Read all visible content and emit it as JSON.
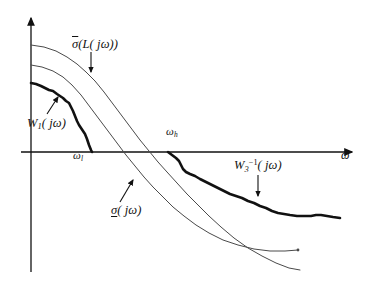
{
  "figure": {
    "kind": "loop-shaping-singular-value-plot",
    "background_color": "#ffffff",
    "ink_color": "#111111",
    "thin_curve_color": "#4a4a4a"
  },
  "axes": {
    "x_axis": {
      "label": "ω",
      "y_pixel": 152,
      "x_start": 21,
      "x_end": 352,
      "arrow": "right"
    },
    "y_axis": {
      "label": "",
      "x_pixel": 31,
      "y_top": 18,
      "y_bottom": 272,
      "arrow": "up"
    }
  },
  "tick_labels": [
    {
      "name": "omega-l",
      "base": "ω",
      "subscript": "l",
      "x": 73,
      "y": 150
    },
    {
      "name": "omega-h",
      "base": "ω",
      "subscript": "h",
      "x": 166,
      "y": 126
    }
  ],
  "annotations": [
    {
      "name": "sigma-bar-L",
      "text_parts": {
        "sigma": "σ",
        "rest": "(L( jω))"
      },
      "overbar": true,
      "underbar": false,
      "arrow": {
        "x1": 91,
        "y1": 52,
        "x2": 91,
        "y2": 72,
        "direction": "down"
      }
    },
    {
      "name": "W1",
      "text_parts": {
        "base": "W",
        "subscript": "1",
        "rest": "( jω)"
      },
      "arrow": {
        "x1": 47,
        "y1": 114,
        "x2": 58,
        "y2": 97,
        "direction": "up-right"
      }
    },
    {
      "name": "sigma-underline",
      "text_parts": {
        "sigma": "σ",
        "rest": "( jω)"
      },
      "overbar": false,
      "underbar": true,
      "arrow": {
        "x1": 120,
        "y1": 202,
        "x2": 133,
        "y2": 180,
        "direction": "up-right"
      }
    },
    {
      "name": "W3-inverse",
      "text_parts": {
        "base": "W",
        "subscript": "3",
        "superscript": "−1",
        "rest": "( jω)"
      },
      "arrow": {
        "x1": 258,
        "y1": 175,
        "x2": 258,
        "y2": 196,
        "direction": "down"
      }
    }
  ],
  "chart_data": {
    "type": "line",
    "title": "",
    "xlabel": "ω",
    "ylabel": "",
    "grid": false,
    "legend": "inline-annotations",
    "note": "Magnitude (dB) versus frequency on a log axis; curves given as pixel polylines in the figure coordinate frame (origin of axes at x=31, y=152).",
    "series": [
      {
        "name": "sigma-bar-L",
        "label": "σ̄(L( jω))",
        "style": "thin",
        "width": 1,
        "color": "#4a4a4a",
        "points": [
          [
            31,
            45
          ],
          [
            44,
            47
          ],
          [
            56,
            51
          ],
          [
            67,
            57
          ],
          [
            77,
            64
          ],
          [
            86,
            72
          ],
          [
            95,
            81
          ],
          [
            104,
            92
          ],
          [
            113,
            104
          ],
          [
            122,
            116
          ],
          [
            131,
            128
          ],
          [
            140,
            140
          ],
          [
            149,
            151
          ],
          [
            158,
            162
          ],
          [
            167,
            172
          ],
          [
            177,
            183
          ],
          [
            187,
            194
          ],
          [
            198,
            205
          ],
          [
            209,
            216
          ],
          [
            221,
            227
          ],
          [
            234,
            238
          ],
          [
            248,
            248
          ],
          [
            262,
            256
          ],
          [
            276,
            263
          ],
          [
            289,
            268
          ],
          [
            300,
            270
          ]
        ]
      },
      {
        "name": "sigma-underline",
        "label": "σ̲( jω)",
        "style": "thin",
        "width": 1,
        "color": "#4a4a4a",
        "points": [
          [
            31,
            65
          ],
          [
            42,
            67
          ],
          [
            53,
            71
          ],
          [
            63,
            77
          ],
          [
            72,
            85
          ],
          [
            81,
            95
          ],
          [
            90,
            107
          ],
          [
            99,
            119
          ],
          [
            108,
            131
          ],
          [
            117,
            143
          ],
          [
            126,
            155
          ],
          [
            135,
            166
          ],
          [
            144,
            177
          ],
          [
            153,
            187
          ],
          [
            163,
            197
          ],
          [
            173,
            207
          ],
          [
            184,
            216
          ],
          [
            196,
            225
          ],
          [
            209,
            233
          ],
          [
            223,
            240
          ],
          [
            238,
            245
          ],
          [
            254,
            249
          ],
          [
            270,
            251
          ],
          [
            285,
            251
          ],
          [
            298,
            250
          ]
        ]
      },
      {
        "name": "W1",
        "label": "W₁( jω)",
        "style": "bold",
        "width": 2.6,
        "color": "#111111",
        "points": [
          [
            31,
            83
          ],
          [
            36,
            84
          ],
          [
            41,
            86
          ],
          [
            45,
            88
          ],
          [
            49,
            90
          ],
          [
            53,
            91
          ],
          [
            57,
            94
          ],
          [
            60,
            96
          ],
          [
            63,
            98
          ],
          [
            66,
            101
          ],
          [
            69,
            103
          ],
          [
            71,
            107
          ],
          [
            73,
            111
          ],
          [
            75,
            116
          ],
          [
            77,
            121
          ],
          [
            79,
            125
          ],
          [
            81,
            128
          ],
          [
            83,
            131
          ],
          [
            85,
            134
          ],
          [
            87,
            139
          ],
          [
            89,
            145
          ],
          [
            91,
            150
          ],
          [
            92,
            152
          ]
        ]
      },
      {
        "name": "W3-inverse",
        "label": "W₃⁻¹( jω)",
        "style": "bold",
        "width": 2.6,
        "color": "#111111",
        "points": [
          [
            168,
            152
          ],
          [
            172,
            155
          ],
          [
            176,
            158
          ],
          [
            179,
            161
          ],
          [
            181,
            165
          ],
          [
            183,
            169
          ],
          [
            186,
            172
          ],
          [
            190,
            174
          ],
          [
            195,
            176
          ],
          [
            200,
            179
          ],
          [
            206,
            182
          ],
          [
            212,
            185
          ],
          [
            218,
            188
          ],
          [
            224,
            191
          ],
          [
            230,
            194
          ],
          [
            236,
            196
          ],
          [
            242,
            198
          ],
          [
            248,
            201
          ],
          [
            254,
            203
          ],
          [
            260,
            206
          ],
          [
            266,
            208
          ],
          [
            272,
            211
          ],
          [
            278,
            213
          ],
          [
            284,
            214
          ],
          [
            290,
            215
          ],
          [
            297,
            216
          ],
          [
            304,
            216
          ],
          [
            311,
            216
          ],
          [
            316,
            215
          ],
          [
            321,
            215
          ],
          [
            327,
            216
          ],
          [
            333,
            217
          ],
          [
            340,
            218
          ]
        ]
      }
    ]
  }
}
